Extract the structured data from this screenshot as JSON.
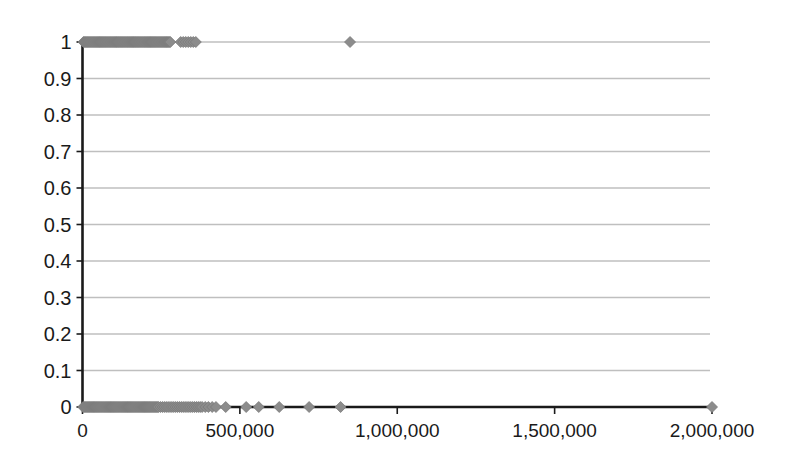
{
  "chart_data": {
    "type": "scatter",
    "title": "",
    "subtitle": "",
    "xlabel": "",
    "ylabel": "",
    "xlim": [
      0,
      2000000
    ],
    "ylim": [
      0,
      1
    ],
    "grid": true,
    "grid_axis": "y",
    "legend": false,
    "legend_position": "none",
    "marker": {
      "shape": "diamond",
      "color": "#8c8c8c",
      "edge_color": "#7a7a7a",
      "size_px": 11
    },
    "axis_color": "#1a1a1a",
    "grid_color": "#bfbfbf",
    "xticks": [
      0,
      500000,
      1000000,
      1500000,
      2000000
    ],
    "xtick_labels": [
      "0",
      "500,000",
      "1,000,000",
      "1,500,000",
      "2,000,000"
    ],
    "yticks": [
      0,
      0.1,
      0.2,
      0.3,
      0.4,
      0.5,
      0.6,
      0.7,
      0.8,
      0.9,
      1
    ],
    "ytick_labels": [
      "0",
      "0.1",
      "0.2",
      "0.3",
      "0.4",
      "0.5",
      "0.6",
      "0.7",
      "0.8",
      "0.9",
      "1"
    ],
    "series": [
      {
        "name": "outcome",
        "x": [
          3000,
          6000,
          9000,
          12000,
          15000,
          18000,
          21000,
          24000,
          27000,
          30000,
          33000,
          36000,
          39000,
          42000,
          45000,
          48000,
          51000,
          54000,
          57000,
          60000,
          63000,
          66000,
          69000,
          72000,
          75000,
          78000,
          81000,
          84000,
          87000,
          90000,
          93000,
          96000,
          99000,
          102000,
          105000,
          108000,
          111000,
          114000,
          117000,
          120000,
          123000,
          126000,
          129000,
          132000,
          135000,
          138000,
          141000,
          144000,
          147000,
          150000,
          153000,
          156000,
          159000,
          162000,
          165000,
          168000,
          171000,
          174000,
          177000,
          180000,
          183000,
          186000,
          189000,
          192000,
          195000,
          198000,
          201000,
          204000,
          207000,
          210000,
          213000,
          216000,
          219000,
          222000,
          225000,
          228000,
          231000,
          234000,
          237000,
          240000,
          243000,
          246000,
          249000,
          252000,
          255000,
          258000,
          261000,
          264000,
          267000,
          270000,
          273000,
          276000,
          279000,
          312000,
          320000,
          328000,
          336000,
          344000,
          352000,
          360000,
          850000
        ],
        "y": [
          1,
          1,
          1,
          1,
          1,
          1,
          1,
          1,
          1,
          1,
          1,
          1,
          1,
          1,
          1,
          1,
          1,
          1,
          1,
          1,
          1,
          1,
          1,
          1,
          1,
          1,
          1,
          1,
          1,
          1,
          1,
          1,
          1,
          1,
          1,
          1,
          1,
          1,
          1,
          1,
          1,
          1,
          1,
          1,
          1,
          1,
          1,
          1,
          1,
          1,
          1,
          1,
          1,
          1,
          1,
          1,
          1,
          1,
          1,
          1,
          1,
          1,
          1,
          1,
          1,
          1,
          1,
          1,
          1,
          1,
          1,
          1,
          1,
          1,
          1,
          1,
          1,
          1,
          1,
          1,
          1,
          1,
          1,
          1,
          1,
          1,
          1,
          1,
          1,
          1,
          1,
          1,
          1,
          1,
          1,
          1,
          1,
          1,
          1,
          1,
          1
        ]
      },
      {
        "name": "outcome-zero",
        "x": [
          2000,
          5000,
          8000,
          11000,
          14000,
          17000,
          20000,
          23000,
          26000,
          29000,
          32000,
          35000,
          38000,
          41000,
          44000,
          47000,
          50000,
          53000,
          56000,
          59000,
          62000,
          65000,
          68000,
          71000,
          74000,
          77000,
          80000,
          83000,
          86000,
          89000,
          92000,
          95000,
          98000,
          101000,
          104000,
          107000,
          110000,
          113000,
          116000,
          119000,
          122000,
          125000,
          128000,
          131000,
          134000,
          137000,
          140000,
          143000,
          146000,
          149000,
          152000,
          155000,
          158000,
          161000,
          164000,
          167000,
          170000,
          173000,
          176000,
          179000,
          182000,
          185000,
          188000,
          191000,
          194000,
          197000,
          200000,
          203000,
          206000,
          209000,
          212000,
          215000,
          218000,
          221000,
          224000,
          227000,
          230000,
          233000,
          236000,
          239000,
          242000,
          248000,
          254000,
          260000,
          266000,
          272000,
          278000,
          284000,
          290000,
          296000,
          302000,
          308000,
          314000,
          320000,
          326000,
          332000,
          338000,
          344000,
          350000,
          356000,
          362000,
          368000,
          374000,
          380000,
          390000,
          400000,
          412000,
          424000,
          455000,
          520000,
          560000,
          625000,
          720000,
          820000,
          2000000
        ],
        "y": [
          0,
          0,
          0,
          0,
          0,
          0,
          0,
          0,
          0,
          0,
          0,
          0,
          0,
          0,
          0,
          0,
          0,
          0,
          0,
          0,
          0,
          0,
          0,
          0,
          0,
          0,
          0,
          0,
          0,
          0,
          0,
          0,
          0,
          0,
          0,
          0,
          0,
          0,
          0,
          0,
          0,
          0,
          0,
          0,
          0,
          0,
          0,
          0,
          0,
          0,
          0,
          0,
          0,
          0,
          0,
          0,
          0,
          0,
          0,
          0,
          0,
          0,
          0,
          0,
          0,
          0,
          0,
          0,
          0,
          0,
          0,
          0,
          0,
          0,
          0,
          0,
          0,
          0,
          0,
          0,
          0,
          0,
          0,
          0,
          0,
          0,
          0,
          0,
          0,
          0,
          0,
          0,
          0,
          0,
          0,
          0,
          0,
          0,
          0,
          0,
          0,
          0,
          0,
          0,
          0,
          0,
          0,
          0,
          0,
          0,
          0,
          0,
          0,
          0,
          0
        ]
      }
    ]
  }
}
